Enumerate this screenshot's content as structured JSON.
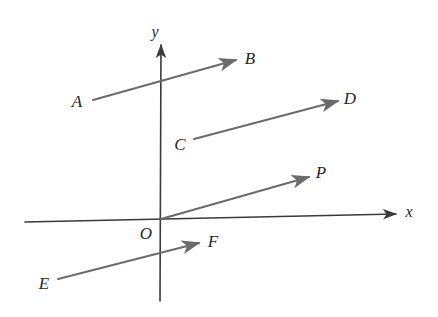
{
  "figure": {
    "background_color": "#ffffff",
    "vector_color": "#6b6b6b",
    "axis_color": "#3a3a3a",
    "label_color": "#262626",
    "width": 438,
    "height": 317
  },
  "axes": {
    "origin": {
      "x": 161,
      "y": 219,
      "label": "O",
      "label_x": 146,
      "label_y": 233
    },
    "x_axis": {
      "label": "x",
      "label_x": 409,
      "label_y": 212,
      "from_x": 25,
      "from_y": 222,
      "to_x": 396,
      "to_y": 214,
      "arrow": "end"
    },
    "y_axis": {
      "label": "y",
      "label_x": 155,
      "label_y": 32,
      "from_x": 160,
      "from_y": 301,
      "to_x": 161,
      "to_y": 45,
      "arrow": "end"
    }
  },
  "vectors": [
    {
      "name": "AB",
      "tail_label": "A",
      "head_label": "B",
      "tail_x": 93,
      "tail_y": 100,
      "head_x": 236,
      "head_y": 60,
      "tail_label_x": 77,
      "tail_label_y": 101,
      "head_label_x": 250,
      "head_label_y": 58
    },
    {
      "name": "CD",
      "tail_label": "C",
      "head_label": "D",
      "tail_x": 194,
      "tail_y": 139,
      "head_x": 338,
      "head_y": 101,
      "tail_label_x": 180,
      "tail_label_y": 144,
      "head_label_x": 350,
      "head_label_y": 98
    },
    {
      "name": "OP",
      "tail_label": "",
      "head_label": "P",
      "tail_x": 161,
      "tail_y": 219,
      "head_x": 309,
      "head_y": 177,
      "tail_label_x": 0,
      "tail_label_y": 0,
      "head_label_x": 321,
      "head_label_y": 172
    },
    {
      "name": "EF",
      "tail_label": "E",
      "head_label": "F",
      "tail_x": 58,
      "tail_y": 279,
      "head_x": 199,
      "head_y": 243,
      "tail_label_x": 44,
      "tail_label_y": 283,
      "head_label_x": 213,
      "head_label_y": 241
    }
  ]
}
